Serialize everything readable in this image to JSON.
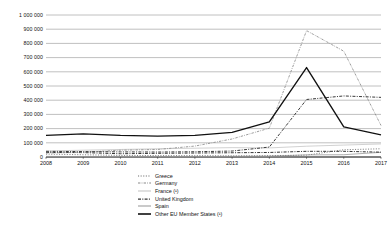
{
  "chart_data": {
    "type": "line",
    "title": "",
    "subtitle": "",
    "xlabel": "",
    "ylabel": "",
    "x": [
      2008,
      2009,
      2010,
      2011,
      2012,
      2013,
      2014,
      2015,
      2016,
      2017
    ],
    "xtick_labels": [
      "2008",
      "2009",
      "2010",
      "2011",
      "2012",
      "2013",
      "2014",
      "2015",
      "2016",
      "2017"
    ],
    "ytick_labels": [
      "0",
      "100 000",
      "200 000",
      "300 000",
      "400 000",
      "500 000",
      "600 000",
      "700 000",
      "800 000",
      "900 000",
      "1 000 000"
    ],
    "ytick_values": [
      0,
      100000,
      200000,
      300000,
      400000,
      500000,
      600000,
      700000,
      800000,
      900000,
      1000000
    ],
    "ylim": [
      0,
      1000000
    ],
    "xlim": [
      2008,
      2017
    ],
    "grid": true,
    "grid_axis": "y",
    "legend_position": "bottom",
    "series": [
      {
        "name": "Greece",
        "style": "dotted",
        "color": "#6e6e6e",
        "values": [
          20000,
          16000,
          11000,
          10000,
          10000,
          8000,
          9500,
          13000,
          51000,
          58000
        ]
      },
      {
        "name": "Germany",
        "style": "dash-dot-dot",
        "color": "#8a8a8a",
        "values": [
          28000,
          33000,
          48000,
          53000,
          77000,
          127000,
          203000,
          890000,
          745000,
          222000
        ]
      },
      {
        "name": "France (¹)",
        "style": "solid-thin",
        "color": "#bdbdbd",
        "values": [
          42000,
          48000,
          53000,
          58000,
          62000,
          66000,
          64000,
          76000,
          84000,
          92000
        ]
      },
      {
        "name": "United Kingdom",
        "style": "dash-dot",
        "color": "#333333",
        "values": [
          32000,
          31000,
          23000,
          26000,
          28000,
          30000,
          32000,
          40000,
          40000,
          34000
        ]
      },
      {
        "name": "Spain",
        "style": "solid-light",
        "color": "#9a9a9a",
        "values": [
          4500,
          3000,
          2700,
          3400,
          2600,
          4500,
          5600,
          15000,
          16000,
          33000
        ]
      },
      {
        "name": "Other EU Member States (¹)",
        "style": "solid-thick",
        "color": "#111111",
        "values": [
          152000,
          163000,
          152000,
          147000,
          152000,
          173000,
          248000,
          630000,
          212000,
          156000
        ]
      }
    ],
    "extra_series": [
      {
        "name": "Greece-upper-band",
        "style": "dash-dot",
        "color": "#3a3a3a",
        "values": [
          40000,
          38000,
          36000,
          35000,
          37000,
          42000,
          70000,
          405000,
          430000,
          420000
        ],
        "note": "upper dash-dot curve peaking near 430 000 in 2016"
      }
    ]
  },
  "axis": {
    "y_gridline_count": 11,
    "x_tick_count": 10
  }
}
